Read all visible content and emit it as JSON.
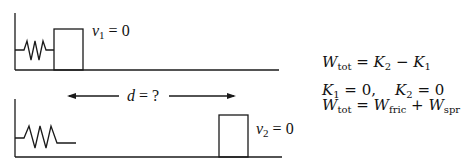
{
  "diagram": {
    "top_scene": {
      "velocity_label": {
        "var": "v",
        "sub": "1",
        "rest": " = 0"
      }
    },
    "distance_label": {
      "var": "d",
      "rest": " = ?"
    },
    "bottom_scene": {
      "velocity_label": {
        "var": "v",
        "sub": "2",
        "rest": " = 0"
      }
    },
    "equations": [
      {
        "lhs_var": "W",
        "lhs_sub": "tot",
        "op": " = ",
        "t1_var": "K",
        "t1_sub": "2",
        "op2": " − ",
        "t2_var": "K",
        "t2_sub": "1"
      },
      {
        "a_var": "K",
        "a_sub": "1",
        "a_rest": " = 0,",
        "gap": "    ",
        "b_var": "K",
        "b_sub": "2",
        "b_rest": " = 0"
      },
      {
        "lhs_var": "W",
        "lhs_sub": "tot",
        "op": " = ",
        "t1_var": "W",
        "t1_sub": "fric",
        "op2": " + ",
        "t2_var": "W",
        "t2_sub": "spr"
      }
    ],
    "colors": {
      "stroke": "#1a1a1a",
      "background": "#ffffff"
    }
  }
}
